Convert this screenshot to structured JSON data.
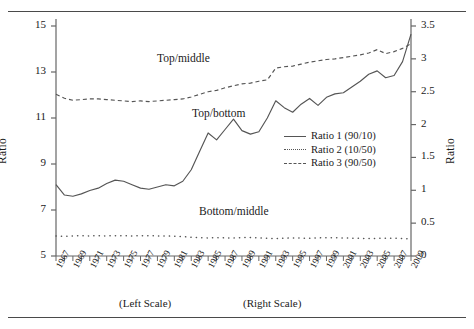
{
  "figure": {
    "ylabel_left": "Ratio",
    "ylabel_right": "Ratio",
    "caption_left": "(Left Scale)",
    "caption_right": "(Right Scale)"
  },
  "annotations": {
    "top_middle": "Top/middle",
    "top_bottom": "Top/bottom",
    "bottom_middle": "Bottom/middle"
  },
  "legend": {
    "items": [
      {
        "label": "Ratio 1 (90/10)",
        "style": "solid"
      },
      {
        "label": "Ratio 2 (10/50)",
        "style": "dotted"
      },
      {
        "label": "Ratio 3 (90/50)",
        "style": "dashed"
      }
    ]
  },
  "chart_data": {
    "type": "line",
    "title": "",
    "xlabel": "",
    "ylabel": "Ratio",
    "ylabel_right": "Ratio",
    "grid": false,
    "legend_position": "center-right",
    "x": [
      1967,
      1968,
      1969,
      1970,
      1971,
      1972,
      1973,
      1974,
      1975,
      1976,
      1977,
      1978,
      1979,
      1980,
      1981,
      1982,
      1983,
      1984,
      1985,
      1986,
      1987,
      1988,
      1989,
      1990,
      1991,
      1992,
      1993,
      1994,
      1995,
      1996,
      1997,
      1998,
      1999,
      2000,
      2001,
      2002,
      2003,
      2004,
      2005,
      2006,
      2007,
      2008,
      2009
    ],
    "xtick_labels": [
      "1967",
      "1969",
      "1971",
      "1973",
      "1975",
      "1977",
      "1979",
      "1981",
      "1983",
      "1985",
      "1987",
      "1989",
      "1991",
      "1993",
      "1995",
      "1997",
      "1999",
      "2001",
      "2003",
      "2005",
      "2007",
      "2009"
    ],
    "xlim": [
      1967,
      2009
    ],
    "axes": {
      "left": {
        "label": "Ratio",
        "ticks": [
          5,
          7,
          9,
          11,
          13,
          15
        ],
        "tick_labels": [
          "5",
          "7",
          "9",
          "11",
          "13",
          "15"
        ],
        "ylim": [
          5,
          15
        ],
        "applies_to": [
          "Ratio 1 (90/10)"
        ],
        "caption": "(Left Scale)"
      },
      "right": {
        "label": "Ratio",
        "ticks": [
          0,
          0.5,
          1,
          1.5,
          2,
          2.5,
          3,
          3.5
        ],
        "tick_labels": [
          "0",
          "0.5",
          "1",
          "1.5",
          "2",
          "2.5",
          "3",
          "3.5"
        ],
        "ylim": [
          0,
          3.5
        ],
        "applies_to": [
          "Ratio 2 (10/50)",
          "Ratio 3 (90/50)"
        ],
        "caption": "(Right Scale)"
      }
    },
    "series": [
      {
        "name": "Ratio 1 (90/10)",
        "annotation": "Top/bottom",
        "axis": "left",
        "style": "solid",
        "color": "#555555",
        "values": [
          8.1,
          7.65,
          7.6,
          7.7,
          7.85,
          7.95,
          8.15,
          8.3,
          8.25,
          8.1,
          7.95,
          7.9,
          8.0,
          8.1,
          8.05,
          8.25,
          8.75,
          9.55,
          10.35,
          10.05,
          10.5,
          10.95,
          10.45,
          10.3,
          10.4,
          11.0,
          11.75,
          11.45,
          11.25,
          11.6,
          11.85,
          11.55,
          11.9,
          12.05,
          12.1,
          12.35,
          12.6,
          12.9,
          13.05,
          12.75,
          12.85,
          13.45,
          14.65
        ]
      },
      {
        "name": "Ratio 2 (10/50)",
        "annotation": "Bottom/middle",
        "axis": "right",
        "style": "dotted",
        "color": "#555555",
        "values": [
          0.305,
          0.3,
          0.305,
          0.31,
          0.305,
          0.31,
          0.305,
          0.31,
          0.31,
          0.305,
          0.31,
          0.31,
          0.305,
          0.305,
          0.3,
          0.295,
          0.285,
          0.28,
          0.275,
          0.28,
          0.275,
          0.275,
          0.28,
          0.28,
          0.275,
          0.27,
          0.265,
          0.27,
          0.275,
          0.272,
          0.27,
          0.275,
          0.278,
          0.278,
          0.275,
          0.272,
          0.268,
          0.266,
          0.268,
          0.27,
          0.27,
          0.265,
          0.258
        ]
      },
      {
        "name": "Ratio 3 (90/50)",
        "annotation": "Top/middle",
        "axis": "right",
        "style": "dashed",
        "color": "#555555",
        "values": [
          2.46,
          2.4,
          2.37,
          2.38,
          2.39,
          2.39,
          2.38,
          2.37,
          2.36,
          2.35,
          2.36,
          2.35,
          2.36,
          2.37,
          2.38,
          2.39,
          2.42,
          2.46,
          2.5,
          2.52,
          2.56,
          2.59,
          2.62,
          2.63,
          2.66,
          2.68,
          2.86,
          2.88,
          2.89,
          2.92,
          2.95,
          2.97,
          2.99,
          3.0,
          3.02,
          3.04,
          3.06,
          3.09,
          3.14,
          3.08,
          3.11,
          3.16,
          3.23
        ]
      }
    ]
  }
}
